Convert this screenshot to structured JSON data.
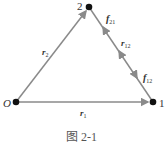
{
  "diagram": {
    "colors": {
      "edge": "#8a8a8a",
      "node": "#111111",
      "text": "#333333"
    },
    "nodes": [
      {
        "id": "O",
        "label": "O",
        "x": 16,
        "y": 102
      },
      {
        "id": "1",
        "label": "1",
        "x": 153,
        "y": 102
      },
      {
        "id": "2",
        "label": "2",
        "x": 89,
        "y": 7
      }
    ],
    "edges": [
      {
        "from": "O",
        "to": "2",
        "label": "r",
        "sub": "2"
      },
      {
        "from": "O",
        "to": "1",
        "label": "r",
        "sub": "1"
      },
      {
        "from": "2",
        "to": "1",
        "label": "r",
        "sub": "12"
      }
    ],
    "forces": [
      {
        "label": "f",
        "sub": "21"
      },
      {
        "label": "f",
        "sub": "12"
      }
    ],
    "caption": "图 2-1"
  }
}
